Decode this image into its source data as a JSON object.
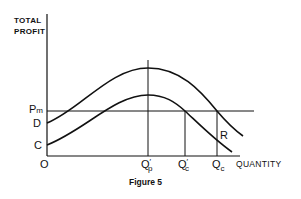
{
  "figure": {
    "caption": "Figure 5",
    "y_axis_label_line1": "TOTAL",
    "y_axis_label_line2": "PROFIT",
    "x_axis_label": "QUANTITY",
    "origin_label": "O",
    "y_points": {
      "pm": {
        "main": "P",
        "sub": "m"
      },
      "d": "D",
      "c": "C"
    },
    "x_points": {
      "qp_prime": {
        "main": "Q",
        "prime": "′",
        "sub": "p"
      },
      "qc_prime": {
        "main": "Q",
        "prime": "′",
        "sub": "c"
      },
      "qc": {
        "main": "Q",
        "sub": "c"
      }
    },
    "region_label": "R"
  },
  "diagram": {
    "curves": [
      {
        "name": "upper-profit-curve",
        "starts_at": "D",
        "peak_at": "Q'p"
      },
      {
        "name": "lower-profit-curve",
        "starts_at": "C",
        "peak_at": "Q'p"
      }
    ],
    "horizontal_line": "Pm",
    "vertical_lines": [
      "Q'p",
      "Q'c",
      "Qc"
    ]
  }
}
